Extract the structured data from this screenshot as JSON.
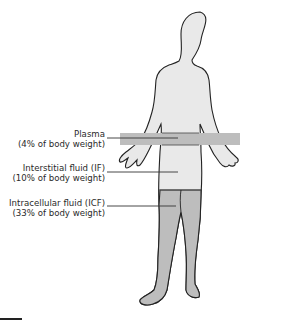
{
  "figure": {
    "type": "body-fluid-compartments",
    "colors": {
      "body_fill": "#e9e9e9",
      "band_fill": "#bdbdbd",
      "outline": "#222222",
      "text": "#2a2a2a"
    }
  },
  "labels": [
    {
      "id": "plasma",
      "name": "Plasma",
      "detail": "(4% of body weight)"
    },
    {
      "id": "if",
      "name": "Interstitial fluid (IF)",
      "detail": "(10% of body weight)"
    },
    {
      "id": "icf",
      "name": "Intracellular fluid (ICF)",
      "detail": "(33% of body weight)"
    }
  ]
}
